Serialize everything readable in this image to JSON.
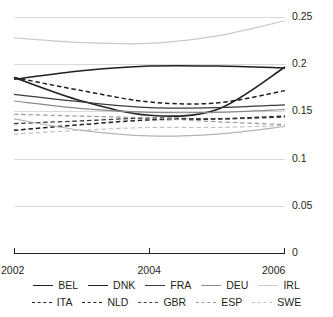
{
  "chart_data": {
    "type": "line",
    "title": "",
    "xlabel": "",
    "ylabel": "",
    "xlim": [
      2002,
      2006
    ],
    "ylim": [
      0,
      0.25
    ],
    "grid": true,
    "x": [
      2002,
      2003,
      2004,
      2005,
      2006
    ],
    "xticks": [
      "2002",
      "2004",
      "2006"
    ],
    "xtick_values": [
      2002,
      2004,
      2006
    ],
    "yticks": [
      "0",
      "0.05",
      "0.1",
      "0.15",
      "0.2",
      "0.25"
    ],
    "ytick_values": [
      0,
      0.05,
      0.1,
      0.15,
      0.2,
      0.25
    ],
    "legend_position": "bottom",
    "series": [
      {
        "name": "BEL",
        "style": "solid",
        "color": "#231f20",
        "width": 1.5,
        "values": [
          0.184,
          0.193,
          0.198,
          0.198,
          0.196
        ]
      },
      {
        "name": "DNK",
        "style": "solid",
        "color": "#231f20",
        "width": 1.6,
        "values": [
          0.186,
          0.161,
          0.146,
          0.152,
          0.197
        ]
      },
      {
        "name": "FRA",
        "style": "solid",
        "color": "#3c3a3b",
        "width": 1.2,
        "values": [
          0.168,
          0.16,
          0.154,
          0.154,
          0.157
        ]
      },
      {
        "name": "DEU",
        "style": "solid",
        "color": "#8a8a8a",
        "width": 1.2,
        "values": [
          0.161,
          0.153,
          0.149,
          0.149,
          0.152
        ]
      },
      {
        "name": "IRL",
        "style": "solid",
        "color": "#c9c9c9",
        "width": 1.2,
        "values": [
          0.228,
          0.223,
          0.222,
          0.23,
          0.246
        ]
      },
      {
        "name": "ITA",
        "style": "dashed",
        "color": "#231f20",
        "width": 1.5,
        "values": [
          0.186,
          0.172,
          0.16,
          0.159,
          0.172
        ]
      },
      {
        "name": "NLD",
        "style": "dashed",
        "color": "#231f20",
        "width": 1.5,
        "values": [
          0.13,
          0.136,
          0.141,
          0.142,
          0.145
        ]
      },
      {
        "name": "GBR",
        "style": "dashed",
        "color": "#3c3a3b",
        "width": 1.3,
        "values": [
          0.137,
          0.14,
          0.143,
          0.142,
          0.144
        ]
      },
      {
        "name": "ESP",
        "style": "dashed",
        "color": "#9a9a9a",
        "width": 1.2,
        "values": [
          0.147,
          0.145,
          0.143,
          0.139,
          0.136
        ]
      },
      {
        "name": "SWE",
        "style": "dashed",
        "color": "#c2c2c2",
        "width": 1.2,
        "values": [
          0.126,
          0.13,
          0.133,
          0.133,
          0.135
        ]
      }
    ],
    "extra_series": [
      {
        "name": "lower-solid-gray",
        "style": "solid",
        "color": "#b3b3b3",
        "width": 1.2,
        "values": [
          0.142,
          0.13,
          0.124,
          0.126,
          0.134
        ]
      }
    ]
  },
  "legend": {
    "row1": [
      "BEL",
      "DNK",
      "FRA",
      "DEU",
      "IRL"
    ],
    "row2": [
      "ITA",
      "NLD",
      "GBR",
      "ESP",
      "SWE"
    ]
  }
}
